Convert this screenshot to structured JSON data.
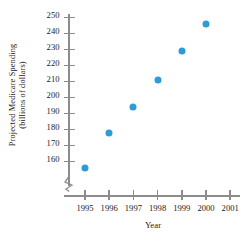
{
  "chart_data": {
    "type": "scatter",
    "title": "",
    "xlabel": "Year",
    "ylabel_line1": "Projected Medicare Spending",
    "ylabel_line2": "(billions of dollars)",
    "x": [
      1995,
      1996,
      1997,
      1998,
      1999,
      2000
    ],
    "values": [
      156,
      178,
      194,
      211,
      229,
      246
    ],
    "points": [
      {
        "x": 1995,
        "y": 156
      },
      {
        "x": 1996,
        "y": 178
      },
      {
        "x": 1997,
        "y": 194
      },
      {
        "x": 1998,
        "y": 211
      },
      {
        "x": 1999,
        "y": 229
      },
      {
        "x": 2000,
        "y": 246
      }
    ],
    "xticks": [
      1995,
      1996,
      1997,
      1998,
      1999,
      2000,
      2001
    ],
    "xtick_labels": [
      "1995",
      "1996",
      "1997",
      "1998",
      "1999",
      "2000",
      "2001"
    ],
    "yticks": [
      160,
      170,
      180,
      190,
      200,
      210,
      220,
      230,
      240,
      250
    ],
    "ytick_labels": [
      "160",
      "170",
      "180",
      "190",
      "200",
      "210",
      "220",
      "230",
      "240",
      "250"
    ],
    "xlim": [
      1994.5,
      2001.5
    ],
    "ylim": [
      160,
      250
    ],
    "y_axis_break": true,
    "grid": false,
    "legend": false,
    "marker_color": "#2e9bd6",
    "axis_color": "#8c8c8c",
    "text_color": "#1a1a1a"
  }
}
